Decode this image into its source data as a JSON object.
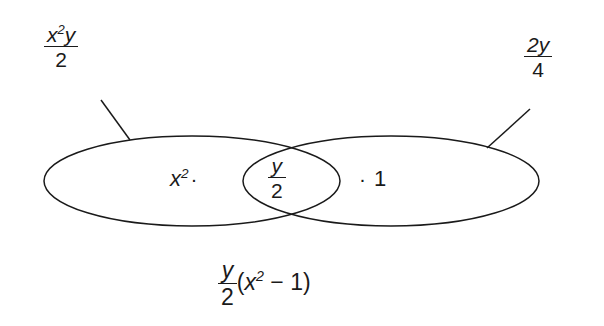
{
  "diagram": {
    "type": "venn-two-set-overlap",
    "background_color": "#ffffff",
    "stroke_color": "#1a1a1a",
    "labels": {
      "left_callout": {
        "numerator_base": "x",
        "numerator_exponent": "2",
        "numerator_tail": "y",
        "denominator": "2",
        "plain": "x²y/2"
      },
      "right_callout": {
        "numerator": "2y",
        "denominator": "4",
        "plain": "2y/4"
      },
      "left_region": {
        "base": "x",
        "exponent": "2",
        "operator": "·",
        "plain": "x² ·"
      },
      "intersection": {
        "numerator": "y",
        "denominator": "2",
        "plain": "y/2"
      },
      "right_region": {
        "operator": "·",
        "value": "1",
        "plain": "· 1"
      },
      "caption": {
        "numerator": "y",
        "denominator": "2",
        "open_paren": "(",
        "base": "x",
        "exponent": "2",
        "minus": "−",
        "one": "1",
        "close_paren": ")",
        "plain": "y/2 (x² − 1)"
      }
    },
    "geometry": {
      "left_ellipse": {
        "cx": 192,
        "cy": 181,
        "rx": 148,
        "ry": 45
      },
      "right_ellipse": {
        "cx": 391,
        "cy": 181,
        "rx": 148,
        "ry": 45
      },
      "left_leader_line": {
        "x1": 101,
        "y1": 100,
        "x2": 130,
        "y2": 140
      },
      "right_leader_line": {
        "x1": 530,
        "y1": 109,
        "x2": 487,
        "y2": 148
      }
    }
  }
}
